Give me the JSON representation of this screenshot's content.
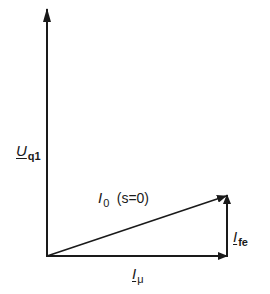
{
  "diagram": {
    "type": "phasor-diagram",
    "stroke_color": "#1a1a1a",
    "vectors": [
      {
        "id": "Uq1",
        "from": [
          47,
          256
        ],
        "to": [
          47,
          9
        ]
      },
      {
        "id": "Imu",
        "from": [
          47,
          256
        ],
        "to": [
          227,
          256
        ]
      },
      {
        "id": "Ife",
        "from": [
          227,
          256
        ],
        "to": [
          227,
          195
        ]
      },
      {
        "id": "I0",
        "from": [
          47,
          256
        ],
        "to": [
          227,
          195
        ]
      }
    ],
    "labels": {
      "uq1": {
        "main": "U",
        "sub": "q1"
      },
      "i0": {
        "main": "I",
        "sub": "0",
        "condition": "(s=0)"
      },
      "ife": {
        "main": "I",
        "sub": "fe"
      },
      "imu": {
        "main": "I",
        "sub": "μ"
      }
    }
  }
}
